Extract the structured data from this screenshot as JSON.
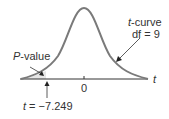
{
  "diagram": {
    "curve_label": {
      "var": "t",
      "rest": "-curve"
    },
    "df_label": "df = 9",
    "pvalue_label": {
      "var": "P",
      "rest": "-value"
    },
    "axis_label": "t",
    "tick_label": "0",
    "t_stat_label": {
      "var": "t",
      "rest": " = −7.249"
    },
    "colors": {
      "curve": "#7a7a7a",
      "axis": "#333333",
      "shade": "#e6e6e6",
      "text": "#333333"
    }
  }
}
